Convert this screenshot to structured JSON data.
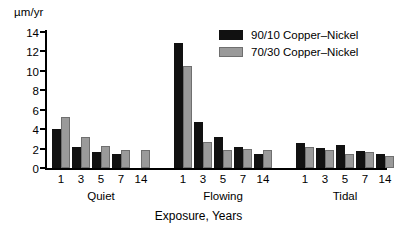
{
  "chart_data": {
    "type": "bar",
    "title": "",
    "subtitle": "",
    "ylabel": "µm/yr",
    "xlabel": "Exposure, Years",
    "ylim": [
      0,
      14
    ],
    "ytick_values": [
      0,
      2,
      4,
      6,
      8,
      10,
      12,
      14
    ],
    "ytick_labels": [
      "0",
      "2",
      "4",
      "6",
      "8",
      "10",
      "12",
      "14"
    ],
    "grid": false,
    "legend_position": "top-right",
    "categories": [
      "1",
      "3",
      "5",
      "7",
      "14"
    ],
    "groups": [
      {
        "name": "Quiet",
        "categories": [
          "1",
          "3",
          "5",
          "7",
          "14"
        ],
        "series": [
          {
            "name": "90/10 Copper–Nickel",
            "values": [
              4.0,
              2.2,
              1.6,
              1.4,
              0.0
            ]
          },
          {
            "name": "70/30 Copper–Nickel",
            "values": [
              5.3,
              3.2,
              2.3,
              1.9,
              1.9
            ]
          }
        ]
      },
      {
        "name": "Flowing",
        "categories": [
          "1",
          "3",
          "5",
          "7",
          "14"
        ],
        "series": [
          {
            "name": "90/10 Copper–Nickel",
            "values": [
              12.9,
              4.7,
              3.2,
              2.2,
              1.4
            ]
          },
          {
            "name": "70/30 Copper–Nickel",
            "values": [
              10.5,
              2.7,
              1.9,
              2.0,
              1.9
            ]
          }
        ]
      },
      {
        "name": "Tidal",
        "categories": [
          "1",
          "3",
          "5",
          "7",
          "14"
        ],
        "series": [
          {
            "name": "90/10 Copper–Nickel",
            "values": [
              2.6,
              2.1,
              2.4,
              1.8,
              1.4
            ]
          },
          {
            "name": "70/30 Copper–Nickel",
            "values": [
              2.2,
              1.9,
              1.4,
              1.6,
              1.2
            ]
          }
        ]
      }
    ],
    "series_colors": [
      "#111111",
      "#9a9a9a"
    ]
  },
  "legend": {
    "entries": [
      {
        "label": "90/10 Copper–Nickel",
        "color": "#111111"
      },
      {
        "label": "70/30 Copper–Nickel",
        "color": "#9a9a9a"
      }
    ]
  },
  "axes": {
    "y_unit_label": "µm/yr",
    "x_title": "Exposure, Years"
  }
}
